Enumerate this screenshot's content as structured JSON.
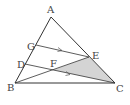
{
  "figure": {
    "type": "triangle-geometry",
    "points": {
      "A": {
        "label": "A",
        "x": 51,
        "y": 17
      },
      "B": {
        "label": "B",
        "x": 15,
        "y": 83
      },
      "C": {
        "label": "C",
        "x": 115,
        "y": 83
      },
      "G": {
        "label": "G",
        "x": 36,
        "y": 45
      },
      "D": {
        "label": "D",
        "x": 25,
        "y": 64
      },
      "E": {
        "label": "E",
        "x": 89,
        "y": 57
      },
      "F": {
        "label": "F",
        "x": 53,
        "y": 70
      }
    },
    "segments": [
      "AB",
      "AC",
      "BC",
      "GE",
      "DC",
      "BE"
    ],
    "parallel_marks": [
      "GE",
      "DC"
    ],
    "shaded_region": [
      "F",
      "E",
      "C"
    ],
    "colors": {
      "stroke": "#333333",
      "shade": "#d4d4d4",
      "label": "#444444"
    }
  }
}
